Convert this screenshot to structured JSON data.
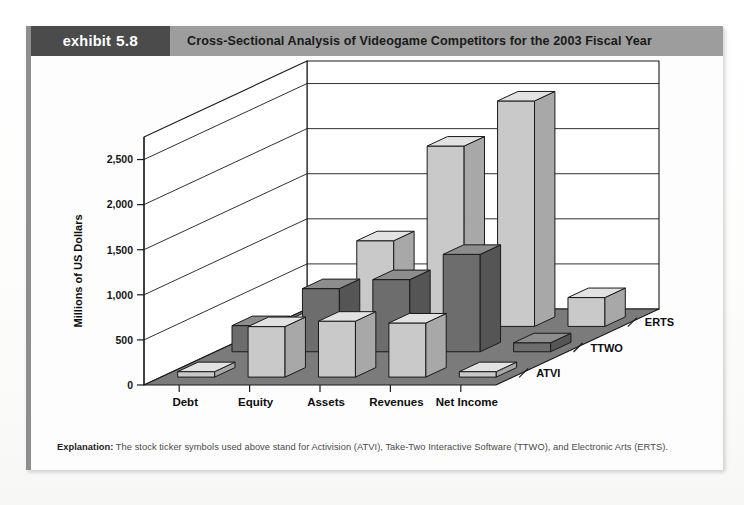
{
  "exhibit": {
    "badge_word": "exhibit",
    "badge_number": "5.8",
    "title": "Cross-Sectional Analysis of Videogame Competitors for the 2003 Fiscal Year",
    "footnote_label": "Explanation:",
    "footnote_text": " The stock ticker symbols used above stand for Activision (ATVI), Take-Two Interactive Software (TTWO), and Electronic Arts (ERTS)."
  },
  "colors": {
    "header_bar": "#9d9d9d",
    "header_badge": "#4b4b4b",
    "badge_text": "#ffffff",
    "floor": "#7b7b7b",
    "wall": "#ffffff",
    "bar_light_front": "#c9c9c9",
    "bar_light_side": "#a8a8a8",
    "bar_light_top": "#e2e2e2",
    "bar_dark_front": "#6d6d6d",
    "bar_dark_side": "#555555",
    "bar_dark_top": "#8d8d8d",
    "outline": "#1a1a1a"
  },
  "chart_data": {
    "type": "bar",
    "variant": "3d-grouped",
    "title": "Cross-Sectional Analysis of Videogame Competitors for the 2003 Fiscal Year",
    "xlabel": "",
    "ylabel": "Millions of US Dollars",
    "zlabel": "",
    "ylim": [
      0,
      2750
    ],
    "yticks": [
      0,
      500,
      1000,
      1500,
      2000,
      2500
    ],
    "ytick_labels": [
      "0",
      "500",
      "1,000",
      "1,500",
      "2,000",
      "2,500"
    ],
    "grid": true,
    "legend": "depth-axis",
    "categories": [
      "Debt",
      "Equity",
      "Assets",
      "Revenues",
      "Net Income"
    ],
    "depth_categories": [
      "ATVI",
      "TTWO",
      "ERTS"
    ],
    "series": [
      {
        "name": "ATVI",
        "shade": "light",
        "values": [
          0,
          560,
          620,
          600,
          60
        ]
      },
      {
        "name": "TTWO",
        "shade": "dark",
        "values": [
          290,
          700,
          800,
          1080,
          100
        ]
      },
      {
        "name": "ERTS",
        "shade": "light",
        "values": [
          0,
          950,
          2000,
          2500,
          320
        ]
      }
    ]
  }
}
